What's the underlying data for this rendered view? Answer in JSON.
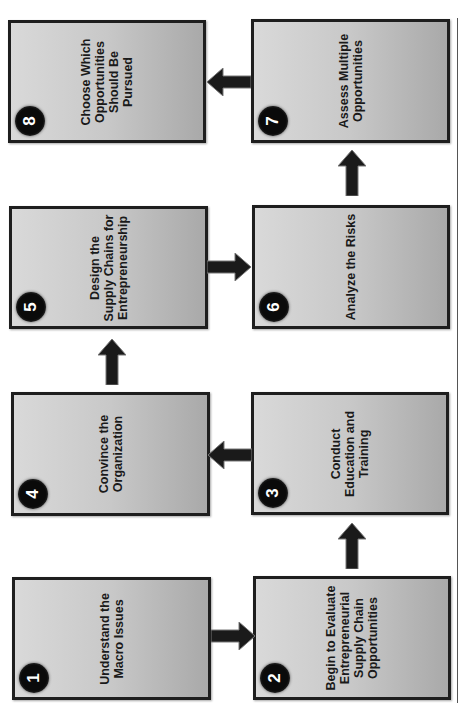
{
  "diagram": {
    "orientation": "rotated -90deg (text reads bottom-to-top)",
    "steps": [
      {
        "number": "1",
        "label": "Understand the\nMacro Issues"
      },
      {
        "number": "2",
        "label": "Begin to Evaluate\nEntrepreneurial\nSupply Chain\nOpportunities"
      },
      {
        "number": "3",
        "label": "Conduct\nEducation and\nTraining"
      },
      {
        "number": "4",
        "label": "Convince the\nOrganization"
      },
      {
        "number": "5",
        "label": "Design the\nSupply Chains for\nEntrepreneurship"
      },
      {
        "number": "6",
        "label": "Analyze the Risks"
      },
      {
        "number": "7",
        "label": "Assess Multiple\nOpportunities"
      },
      {
        "number": "8",
        "label": "Choose Which\nOpportunities\nShould Be\nPursued"
      }
    ],
    "flow": [
      "1→2",
      "2→3",
      "3→4",
      "4→5",
      "5→6",
      "6→7",
      "7→8"
    ],
    "colors": {
      "box_border": "#1e1e1e",
      "box_fill_light": "#d9d9d9",
      "box_fill_dark": "#a9a9a9",
      "badge": "#0a0a0a",
      "arrow": "#1a1a1a"
    }
  }
}
